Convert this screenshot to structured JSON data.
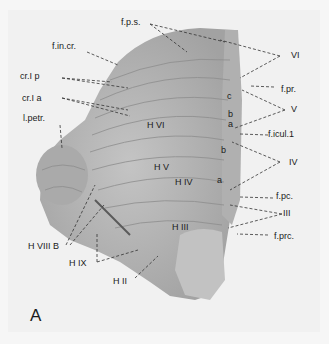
{
  "figure": {
    "panel_letter": "A",
    "colors": {
      "background": "#f1f1f1",
      "tissue": "#b9b9b9",
      "tissue_dark": "#8a8a8a",
      "label": "#1a1a1a"
    }
  },
  "labels": {
    "f_p_s": "f.p.s.",
    "f_in_cr": "f.in.cr.",
    "cr_I_p": "cr.I p",
    "cr_I_a": "cr.I a",
    "l_petr": "l.petr.",
    "roman_VI": "VI",
    "f_pr": "f.pr.",
    "roman_V": "V",
    "f_icul_1": "f.icul.1",
    "roman_IV": "IV",
    "f_pc": "f.pc.",
    "roman_III": "III",
    "f_prc": "f.prc.",
    "H_VI": "H VI",
    "H_V": "H V",
    "H_IV": "H IV",
    "H_III": "H III",
    "H_II": "H II",
    "H_IX": "H IX",
    "H_VIII_B": "H VIII B",
    "c": "c",
    "b_upper": "b",
    "a_upper": "a",
    "b_lower": "b",
    "a_lower": "a"
  }
}
